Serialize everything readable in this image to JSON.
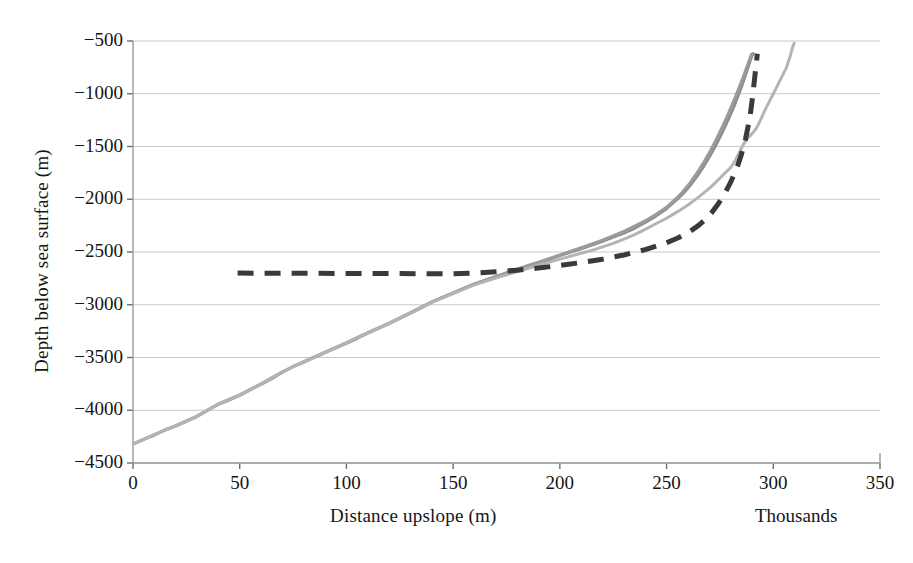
{
  "chart_data": {
    "type": "line",
    "title": "",
    "xlabel": "Distance upslope (m)",
    "ylabel": "Depth below sea surface (m)",
    "x_unit_note": "Thousands",
    "xlim": [
      0,
      350
    ],
    "ylim": [
      -4500,
      -500
    ],
    "xticks": [
      0,
      50,
      100,
      150,
      200,
      250,
      300,
      350
    ],
    "xtick_labels": [
      "0",
      "50",
      "100",
      "150",
      "200",
      "250",
      "300",
      "350"
    ],
    "yticks": [
      -500,
      -1000,
      -1500,
      -2000,
      -2500,
      -3000,
      -3500,
      -4000,
      -4500
    ],
    "ytick_labels": [
      "−500",
      "−1000",
      "−1500",
      "−2000",
      "−2500",
      "−3000",
      "−3500",
      "−4000",
      "−4500"
    ],
    "grid": {
      "horizontal": true,
      "vertical": false,
      "color": "#c9c9c9"
    },
    "legend": {
      "visible": false,
      "position": "none"
    },
    "series": [
      {
        "name": "profile-dark-gray",
        "color": "#8e8e8e",
        "style": "solid",
        "width": 3.0,
        "points": [
          [
            0,
            -4320
          ],
          [
            5,
            -4275
          ],
          [
            10,
            -4235
          ],
          [
            15,
            -4185
          ],
          [
            20,
            -4150
          ],
          [
            25,
            -4105
          ],
          [
            30,
            -4060
          ],
          [
            35,
            -4000
          ],
          [
            40,
            -3945
          ],
          [
            45,
            -3905
          ],
          [
            50,
            -3860
          ],
          [
            55,
            -3805
          ],
          [
            60,
            -3755
          ],
          [
            65,
            -3700
          ],
          [
            70,
            -3640
          ],
          [
            75,
            -3585
          ],
          [
            80,
            -3545
          ],
          [
            85,
            -3500
          ],
          [
            90,
            -3455
          ],
          [
            95,
            -3410
          ],
          [
            100,
            -3365
          ],
          [
            105,
            -3320
          ],
          [
            110,
            -3270
          ],
          [
            115,
            -3225
          ],
          [
            120,
            -3180
          ],
          [
            125,
            -3130
          ],
          [
            130,
            -3080
          ],
          [
            135,
            -3030
          ],
          [
            140,
            -2975
          ],
          [
            145,
            -2930
          ],
          [
            150,
            -2890
          ],
          [
            155,
            -2845
          ],
          [
            160,
            -2805
          ],
          [
            165,
            -2770
          ],
          [
            170,
            -2735
          ],
          [
            175,
            -2700
          ],
          [
            180,
            -2665
          ],
          [
            185,
            -2630
          ],
          [
            190,
            -2600
          ],
          [
            195,
            -2570
          ],
          [
            200,
            -2535
          ],
          [
            205,
            -2500
          ],
          [
            210,
            -2470
          ],
          [
            215,
            -2435
          ],
          [
            220,
            -2400
          ],
          [
            225,
            -2360
          ],
          [
            230,
            -2320
          ],
          [
            235,
            -2275
          ],
          [
            240,
            -2220
          ],
          [
            245,
            -2160
          ],
          [
            250,
            -2090
          ],
          [
            255,
            -2000
          ],
          [
            258,
            -1940
          ],
          [
            261,
            -1870
          ],
          [
            264,
            -1790
          ],
          [
            267,
            -1700
          ],
          [
            270,
            -1600
          ],
          [
            273,
            -1490
          ],
          [
            276,
            -1370
          ],
          [
            279,
            -1240
          ],
          [
            282,
            -1100
          ],
          [
            285,
            -940
          ],
          [
            287,
            -820
          ],
          [
            289,
            -700
          ],
          [
            290,
            -640
          ],
          [
            291,
            -610
          ]
        ]
      },
      {
        "name": "profile-mid-gray",
        "color": "#9b9b9b",
        "style": "solid",
        "width": 3.0,
        "points": [
          [
            0,
            -4320
          ],
          [
            10,
            -4230
          ],
          [
            20,
            -4145
          ],
          [
            30,
            -4055
          ],
          [
            40,
            -3940
          ],
          [
            50,
            -3855
          ],
          [
            60,
            -3750
          ],
          [
            70,
            -3635
          ],
          [
            80,
            -3540
          ],
          [
            90,
            -3450
          ],
          [
            100,
            -3360
          ],
          [
            110,
            -3265
          ],
          [
            120,
            -3175
          ],
          [
            130,
            -3075
          ],
          [
            140,
            -2972
          ],
          [
            150,
            -2888
          ],
          [
            160,
            -2802
          ],
          [
            170,
            -2732
          ],
          [
            180,
            -2662
          ],
          [
            190,
            -2596
          ],
          [
            200,
            -2528
          ],
          [
            210,
            -2460
          ],
          [
            220,
            -2388
          ],
          [
            230,
            -2305
          ],
          [
            240,
            -2205
          ],
          [
            245,
            -2145
          ],
          [
            250,
            -2075
          ],
          [
            255,
            -1985
          ],
          [
            258,
            -1920
          ],
          [
            261,
            -1845
          ],
          [
            264,
            -1760
          ],
          [
            267,
            -1665
          ],
          [
            270,
            -1560
          ],
          [
            273,
            -1445
          ],
          [
            276,
            -1320
          ],
          [
            279,
            -1185
          ],
          [
            282,
            -1040
          ],
          [
            285,
            -890
          ],
          [
            287,
            -780
          ],
          [
            289,
            -670
          ],
          [
            290,
            -615
          ]
        ]
      },
      {
        "name": "profile-light-gray",
        "color": "#b4b4b4",
        "style": "solid",
        "width": 3.0,
        "points": [
          [
            0,
            -4320
          ],
          [
            10,
            -4232
          ],
          [
            20,
            -4148
          ],
          [
            30,
            -4058
          ],
          [
            40,
            -3942
          ],
          [
            50,
            -3858
          ],
          [
            60,
            -3752
          ],
          [
            70,
            -3638
          ],
          [
            80,
            -3542
          ],
          [
            90,
            -3452
          ],
          [
            100,
            -3362
          ],
          [
            110,
            -3268
          ],
          [
            120,
            -3178
          ],
          [
            130,
            -3078
          ],
          [
            140,
            -2978
          ],
          [
            150,
            -2895
          ],
          [
            160,
            -2812
          ],
          [
            170,
            -2748
          ],
          [
            180,
            -2685
          ],
          [
            190,
            -2625
          ],
          [
            200,
            -2568
          ],
          [
            210,
            -2512
          ],
          [
            215,
            -2485
          ],
          [
            220,
            -2452
          ],
          [
            225,
            -2418
          ],
          [
            230,
            -2378
          ],
          [
            235,
            -2335
          ],
          [
            240,
            -2285
          ],
          [
            245,
            -2232
          ],
          [
            250,
            -2180
          ],
          [
            255,
            -2120
          ],
          [
            260,
            -2055
          ],
          [
            265,
            -1980
          ],
          [
            268,
            -1930
          ],
          [
            271,
            -1880
          ],
          [
            274,
            -1820
          ],
          [
            277,
            -1760
          ],
          [
            280,
            -1700
          ],
          [
            282,
            -1640
          ],
          [
            284,
            -1560
          ],
          [
            286,
            -1480
          ],
          [
            288,
            -1420
          ],
          [
            290,
            -1380
          ],
          [
            292,
            -1330
          ],
          [
            294,
            -1250
          ],
          [
            296,
            -1160
          ],
          [
            298,
            -1080
          ],
          [
            300,
            -1000
          ],
          [
            302,
            -920
          ],
          [
            304,
            -840
          ],
          [
            306,
            -760
          ],
          [
            307,
            -700
          ],
          [
            308,
            -640
          ],
          [
            309,
            -560
          ],
          [
            310,
            -510
          ]
        ]
      },
      {
        "name": "model-dashed",
        "color": "#3a3a3a",
        "style": "dashed",
        "width": 5.0,
        "points": [
          [
            49,
            -2700
          ],
          [
            80,
            -2702
          ],
          [
            110,
            -2704
          ],
          [
            140,
            -2706
          ],
          [
            150,
            -2707
          ],
          [
            160,
            -2700
          ],
          [
            170,
            -2688
          ],
          [
            180,
            -2672
          ],
          [
            190,
            -2652
          ],
          [
            200,
            -2628
          ],
          [
            210,
            -2600
          ],
          [
            220,
            -2568
          ],
          [
            230,
            -2528
          ],
          [
            240,
            -2478
          ],
          [
            250,
            -2412
          ],
          [
            255,
            -2370
          ],
          [
            260,
            -2318
          ],
          [
            265,
            -2248
          ],
          [
            268,
            -2195
          ],
          [
            271,
            -2130
          ],
          [
            274,
            -2050
          ],
          [
            277,
            -1955
          ],
          [
            280,
            -1840
          ],
          [
            283,
            -1700
          ],
          [
            285,
            -1580
          ],
          [
            287,
            -1430
          ],
          [
            289,
            -1230
          ],
          [
            290,
            -1080
          ],
          [
            291,
            -900
          ],
          [
            292,
            -720
          ],
          [
            292.5,
            -620
          ]
        ]
      }
    ]
  },
  "axis": {
    "x_title": "Distance upslope (m)",
    "y_title": "Depth below sea surface (m)",
    "thousands_note": "Thousands"
  }
}
